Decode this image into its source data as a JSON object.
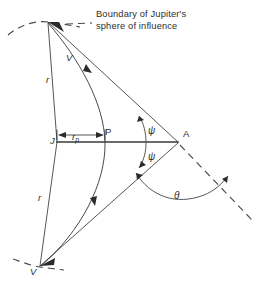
{
  "figure": {
    "title_caption": "Boundary of Jupiter's",
    "title_caption_line2": "sphere of influence",
    "background_color": "#ffffff",
    "line_color": "#2b2b2b",
    "dash_color": "#4a4a4a"
  },
  "labels": {
    "jupiter_center": "J",
    "periapsis": "P",
    "apex": "A",
    "velocity_in": "V",
    "velocity_out": "V",
    "radius_upper": "r",
    "radius_lower": "r",
    "periapsis_radius_main": "r",
    "periapsis_radius_sub": "p",
    "psi_upper": "ψ",
    "psi_lower": "ψ",
    "theta": "θ"
  },
  "geometry": {
    "point_J": [
      57,
      142
    ],
    "point_P": [
      105,
      142
    ],
    "point_A": [
      178,
      142
    ],
    "point_V_top": [
      48,
      22
    ],
    "point_V_bottom": [
      40,
      267
    ],
    "dimension_label_rp": "r_p",
    "angles": [
      "ψ",
      "ψ",
      "θ"
    ]
  }
}
